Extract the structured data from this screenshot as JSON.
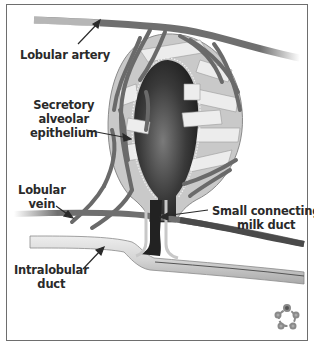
{
  "figure": {
    "labels": {
      "lobular_artery": "Lobular artery",
      "secretory_alveolar_epithelium": [
        "Secretory",
        "alveolar",
        "epithelium"
      ],
      "lobular_vein": [
        "Lobular",
        "vein"
      ],
      "small_connecting_milk_duct": [
        "Small connecting",
        "milk duct"
      ],
      "intralobular_duct": [
        "Intralobular",
        "duct"
      ]
    },
    "logo_icon": "flower-ring-logo",
    "colors": {
      "frame": "#6e6e6e",
      "vessel": "#6f6f6f",
      "lumen_dark": "#2b2b2b",
      "lumen_mid": "#7a7a7a",
      "epithelium": "#bdbdbd",
      "band_light": "#e6e6e6",
      "duct": "#d9d9d9",
      "text": "#2a2a2a"
    }
  }
}
